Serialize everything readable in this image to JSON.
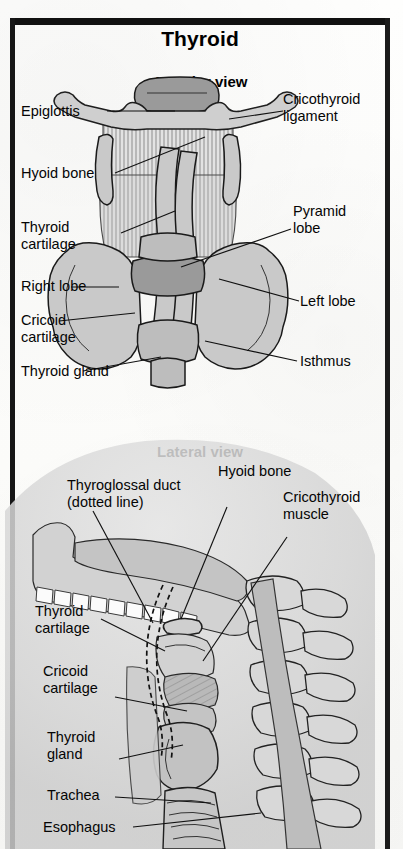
{
  "page": {
    "title": "Thyroid",
    "background_color": "#fbfbf9",
    "frame_color": "#111111",
    "organ_fill": "#c9c9c9",
    "outline_color": "#1a1a1a"
  },
  "anterior": {
    "heading": "Anterior view",
    "labels": {
      "epiglottis": "Epiglottis",
      "hyoid_bone": "Hyoid bone",
      "thyroid_cartilage": "Thyroid\ncartilage",
      "right_lobe": "Right lobe",
      "cricoid_cartilage": "Cricoid\ncartilage",
      "thyroid_gland": "Thyroid gland",
      "cricothyroid_ligament": "Cricothyroid\nligament",
      "pyramid_lobe": "Pyramid\nlobe",
      "left_lobe": "Left lobe",
      "isthmus": "Isthmus"
    }
  },
  "lateral": {
    "heading": "Lateral view",
    "labels": {
      "thyroglossal_duct": "Thyroglossal duct\n(dotted line)",
      "hyoid_bone": "Hyoid bone",
      "cricothyroid_muscle": "Cricothyroid\nmuscle",
      "thyroid_cartilage": "Thyroid\ncartilage",
      "cricoid_cartilage": "Cricoid\ncartilage",
      "thyroid_gland": "Thyroid\ngland",
      "trachea": "Trachea",
      "esophagus": "Esophagus"
    }
  }
}
